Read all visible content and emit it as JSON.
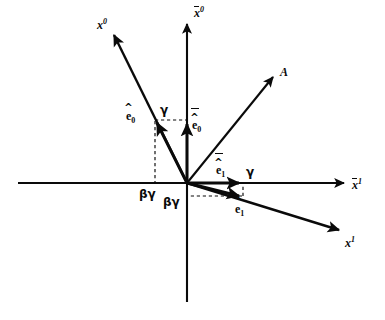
{
  "figure": {
    "background_color": "#ffffff",
    "line_color": "#0a0a0a",
    "origin": {
      "x": 187,
      "y": 183
    }
  },
  "axes": [
    {
      "id": "x0-prime",
      "label_base": "x",
      "label_sup": "0",
      "accent": "none",
      "description": "boosted time axis, up-left",
      "label_pos": {
        "x": 97,
        "y": 18
      },
      "tip": {
        "x": 112,
        "y": 32
      }
    },
    {
      "id": "x0-bar",
      "label_base": "x",
      "label_sup": "0",
      "accent": "bar",
      "description": "vertical time axis",
      "label_pos": {
        "x": 194,
        "y": 6
      },
      "tip": {
        "x": 187,
        "y": 20
      }
    },
    {
      "id": "x1-bar",
      "label_base": "x",
      "label_sup": "1",
      "accent": "bar",
      "description": "horizontal space axis",
      "label_pos": {
        "x": 352,
        "y": 178
      },
      "tip": {
        "x": 348,
        "y": 183
      }
    },
    {
      "id": "x1-prime",
      "label_base": "x",
      "label_sup": "1",
      "accent": "none",
      "description": "boosted space axis, down-right",
      "label_pos": {
        "x": 345,
        "y": 236
      },
      "tip": {
        "x": 342,
        "y": 232
      }
    }
  ],
  "vectors": [
    {
      "id": "e0-hat",
      "label_base": "e",
      "label_sub": "0",
      "accents": [
        "hat"
      ],
      "description": "boosted timelike unit basis vector",
      "label_pos": {
        "x": 126,
        "y": 110
      },
      "tip": {
        "x": 155,
        "y": 120
      }
    },
    {
      "id": "e0-hat-bar",
      "label_base": "e",
      "label_sub": "0",
      "accents": [
        "hat",
        "bar"
      ],
      "description": "unboosted timelike unit basis vector",
      "label_pos": {
        "x": 192,
        "y": 119
      },
      "tip": {
        "x": 187,
        "y": 120
      }
    },
    {
      "id": "e1-hat-bar",
      "label_base": "e",
      "label_sub": "1",
      "accents": [
        "hat",
        "bar"
      ],
      "description": "unboosted spacelike unit basis vector",
      "label_pos": {
        "x": 216,
        "y": 164
      },
      "tip": {
        "x": 243,
        "y": 183
      }
    },
    {
      "id": "e1-hat",
      "label_base": "e",
      "label_sub": "1",
      "accents": [
        "hat"
      ],
      "description": "boosted spacelike unit basis vector",
      "label_pos": {
        "x": 235,
        "y": 203
      },
      "tip": {
        "x": 243,
        "y": 197
      }
    },
    {
      "id": "vector-A",
      "label_base": "A",
      "label_sub": "",
      "accents": [],
      "description": "arbitrary four-vector A",
      "label_pos": {
        "x": 280,
        "y": 66
      },
      "tip": {
        "x": 276,
        "y": 74
      }
    }
  ],
  "annotations": [
    {
      "id": "gamma-vertical",
      "text": "γ",
      "description": "gamma component of e0-hat along the x0-bar axis",
      "pos": {
        "x": 160,
        "y": 104
      }
    },
    {
      "id": "gamma-horizontal",
      "text": "γ",
      "description": "gamma component of e1-hat-bar along the x1-bar axis",
      "pos": {
        "x": 246,
        "y": 166
      }
    },
    {
      "id": "betagamma-left",
      "text": "βγ",
      "description": "beta-gamma component of e0-hat along the x1-bar axis",
      "pos": {
        "x": 139,
        "y": 188
      }
    },
    {
      "id": "betagamma-right",
      "text": "βγ",
      "description": "beta-gamma component of e1-hat below the x1-bar axis",
      "pos": {
        "x": 163,
        "y": 196
      }
    }
  ]
}
